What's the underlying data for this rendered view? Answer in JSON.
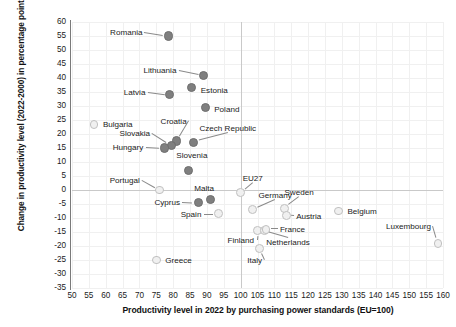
{
  "chart_data": {
    "type": "scatter",
    "title": "",
    "xlabel": "Productivity level in 2022 by purchasing power standards (EU=100)",
    "ylabel": "Change in productivity level (2022-2000) in percentage points",
    "xlim": [
      50,
      160
    ],
    "ylim": [
      -35,
      60
    ],
    "xticks": [
      50,
      55,
      60,
      65,
      70,
      75,
      80,
      85,
      90,
      95,
      100,
      105,
      110,
      115,
      120,
      125,
      130,
      135,
      140,
      145,
      150,
      155,
      160
    ],
    "yticks": [
      60,
      55,
      50,
      45,
      40,
      35,
      30,
      25,
      20,
      15,
      10,
      5,
      0,
      -5,
      -10,
      -15,
      -20,
      -25,
      -30,
      -35
    ],
    "grid": true,
    "legend": "none",
    "reference_lines": {
      "x": 100,
      "y": 0
    },
    "colors": {
      "marker_dark": "#7f7f7f",
      "marker_light": "#f0f0f0",
      "marker_light_edge": "#c0c0c0",
      "gridline": "#f0f0f0",
      "axis": "#7a7a7a",
      "text": "#1a1a1a"
    },
    "points": [
      {
        "name": "Romania",
        "x": 78.5,
        "y": 55.0,
        "style": "dark",
        "label_dx": -58,
        "label_dy": -4,
        "leader": true
      },
      {
        "name": "Lithuania",
        "x": 89.0,
        "y": 41.0,
        "style": "dark",
        "label_dx": -60,
        "label_dy": -5,
        "leader": true
      },
      {
        "name": "Estonia",
        "x": 85.5,
        "y": 36.5,
        "style": "dark",
        "label_dx": 9,
        "label_dy": 2,
        "leader": false
      },
      {
        "name": "Latvia",
        "x": 79.0,
        "y": 34.0,
        "style": "dark",
        "label_dx": -46,
        "label_dy": -3,
        "leader": true
      },
      {
        "name": "Poland",
        "x": 89.5,
        "y": 29.5,
        "style": "dark",
        "label_dx": 9,
        "label_dy": 2,
        "leader": false
      },
      {
        "name": "Bulgaria",
        "x": 56.5,
        "y": 23.5,
        "style": "light",
        "label_dx": 9,
        "label_dy": 0,
        "leader": false
      },
      {
        "name": "Croatia",
        "x": 81.0,
        "y": 17.5,
        "style": "dark",
        "label_dx": -16,
        "label_dy": -20,
        "leader": true
      },
      {
        "name": "Czech Republic",
        "x": 86.0,
        "y": 17.0,
        "style": "dark",
        "label_dx": 6,
        "label_dy": -14,
        "leader": true
      },
      {
        "name": "Slovakia",
        "x": 79.5,
        "y": 16.0,
        "style": "dark",
        "label_dx": -52,
        "label_dy": -12,
        "leader": true
      },
      {
        "name": "Hungary",
        "x": 77.5,
        "y": 15.0,
        "style": "dark",
        "label_dx": -52,
        "label_dy": -1,
        "leader": true
      },
      {
        "name": "Slovenia",
        "x": 84.5,
        "y": 7.0,
        "style": "dark",
        "label_dx": -12,
        "label_dy": -15,
        "leader": false
      },
      {
        "name": "Portugal",
        "x": 76.0,
        "y": 0.0,
        "style": "light",
        "label_dx": -50,
        "label_dy": -10,
        "leader": true
      },
      {
        "name": "EU27",
        "x": 100.0,
        "y": -1.0,
        "style": "light",
        "label_dx": 2,
        "label_dy": -15,
        "leader": true
      },
      {
        "name": "Malta",
        "x": 91.0,
        "y": -3.5,
        "style": "dark",
        "label_dx": -16,
        "label_dy": -12,
        "leader": false
      },
      {
        "name": "Cyprus",
        "x": 87.5,
        "y": -4.5,
        "style": "dark",
        "label_dx": -44,
        "label_dy": -1,
        "leader": true
      },
      {
        "name": "Germany",
        "x": 103.5,
        "y": -7.0,
        "style": "light",
        "label_dx": 6,
        "label_dy": -15,
        "leader": true
      },
      {
        "name": "Sweden",
        "x": 113.0,
        "y": -6.5,
        "style": "light",
        "label_dx": 0,
        "label_dy": -16,
        "leader": true
      },
      {
        "name": "Austria",
        "x": 113.5,
        "y": -9.0,
        "style": "light",
        "label_dx": 10,
        "label_dy": 1,
        "leader": true
      },
      {
        "name": "Belgium",
        "x": 129.0,
        "y": -7.5,
        "style": "light",
        "label_dx": 9,
        "label_dy": 0,
        "leader": false
      },
      {
        "name": "Spain",
        "x": 93.5,
        "y": -8.5,
        "style": "light",
        "label_dx": -38,
        "label_dy": 0,
        "leader": true
      },
      {
        "name": "Finland",
        "x": 105.0,
        "y": -14.5,
        "style": "light",
        "label_dx": -30,
        "label_dy": 9,
        "leader": true
      },
      {
        "name": "Netherlands",
        "x": 107.0,
        "y": -14.5,
        "style": "light",
        "label_dx": 2,
        "label_dy": 11,
        "leader": true
      },
      {
        "name": "France",
        "x": 107.5,
        "y": -14.0,
        "style": "light",
        "label_dx": 14,
        "label_dy": 0,
        "leader": true
      },
      {
        "name": "Luxembourg",
        "x": 158.5,
        "y": -19.0,
        "style": "light",
        "label_dx": -52,
        "label_dy": -17,
        "leader": true
      },
      {
        "name": "Italy",
        "x": 105.5,
        "y": -21.0,
        "style": "light",
        "label_dx": -12,
        "label_dy": 11,
        "leader": true
      },
      {
        "name": "Greece",
        "x": 75.0,
        "y": -25.0,
        "style": "light",
        "label_dx": 9,
        "label_dy": 0,
        "leader": false
      }
    ]
  }
}
